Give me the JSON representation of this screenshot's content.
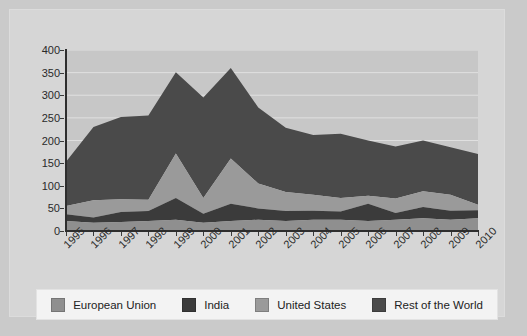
{
  "chart_data": {
    "type": "area",
    "stacked": true,
    "title": "",
    "xlabel": "",
    "ylabel": "",
    "ylim": [
      0,
      400
    ],
    "ytick_step": 50,
    "yticks": [
      400,
      350,
      300,
      250,
      200,
      150,
      100,
      50,
      0
    ],
    "grid": true,
    "grid_color": "#e0e0e0",
    "legend_position": "bottom",
    "plot_background": "#c7c7c7",
    "categories": [
      "1995",
      "1996",
      "1997",
      "1998",
      "1999",
      "2000",
      "2001",
      "2002",
      "2003",
      "2004",
      "2005",
      "2006",
      "2007",
      "2008",
      "2009",
      "2010"
    ],
    "series": [
      {
        "name": "European Union",
        "color": "#8f8f8f",
        "values": [
          22,
          18,
          20,
          22,
          25,
          18,
          22,
          25,
          22,
          25,
          25,
          22,
          25,
          28,
          25,
          28
        ]
      },
      {
        "name": "India",
        "color": "#3b3b3b",
        "values": [
          15,
          12,
          22,
          22,
          48,
          20,
          38,
          25,
          22,
          20,
          18,
          38,
          15,
          25,
          20,
          18
        ]
      },
      {
        "name": "United States",
        "color": "#9a9a9a",
        "values": [
          18,
          38,
          28,
          25,
          98,
          35,
          100,
          55,
          42,
          35,
          30,
          18,
          32,
          35,
          35,
          12
        ]
      },
      {
        "name": "Rest of the World",
        "color": "#4a4a4a",
        "values": [
          98,
          162,
          182,
          186,
          180,
          222,
          200,
          168,
          142,
          132,
          142,
          122,
          115,
          112,
          105,
          112
        ]
      }
    ],
    "totals": [
      153,
      230,
      252,
      255,
      351,
      295,
      360,
      273,
      228,
      212,
      215,
      200,
      187,
      200,
      185,
      170
    ]
  },
  "legend": {
    "items": [
      {
        "label": "European Union",
        "color": "#8f8f8f"
      },
      {
        "label": "India",
        "color": "#3b3b3b"
      },
      {
        "label": "United States",
        "color": "#9a9a9a"
      },
      {
        "label": "Rest of the World",
        "color": "#4a4a4a"
      }
    ]
  }
}
